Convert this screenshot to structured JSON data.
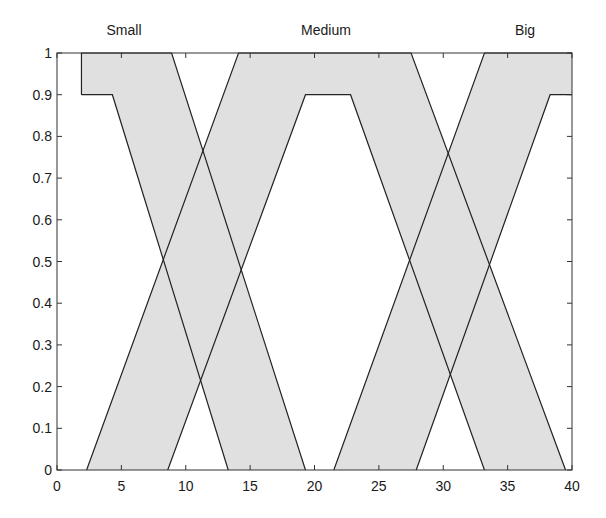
{
  "chart_data": {
    "type": "area",
    "title": "",
    "xlabel": "",
    "ylabel": "",
    "xlim": [
      0,
      40
    ],
    "ylim": [
      0,
      1
    ],
    "grid": false,
    "x_ticks": [
      "0",
      "5",
      "10",
      "15",
      "20",
      "25",
      "30",
      "35",
      "40"
    ],
    "y_ticks": [
      "0",
      "0.1",
      "0.2",
      "0.3",
      "0.4",
      "0.5",
      "0.6",
      "0.7",
      "0.8",
      "0.9",
      "1"
    ],
    "annotations": [
      {
        "text": "Small",
        "x": 8.4
      },
      {
        "text": "Medium",
        "x": 20.9
      },
      {
        "text": "Big",
        "x": 36.4
      }
    ],
    "fill_color": "#e0e0e0",
    "line_color": "#222222",
    "series": [
      {
        "name": "Small",
        "upper": {
          "x": [
            1.9,
            1.9,
            8.9,
            19.3
          ],
          "y": [
            0.9,
            1.0,
            1.0,
            0.0
          ]
        },
        "lower": {
          "x": [
            1.9,
            4.3,
            13.3
          ],
          "y": [
            0.9,
            0.9,
            0.0
          ]
        }
      },
      {
        "name": "Medium",
        "upper": {
          "x": [
            2.3,
            14.1,
            27.5,
            39.5
          ],
          "y": [
            0.0,
            1.0,
            1.0,
            0.0
          ]
        },
        "lower": {
          "x": [
            8.6,
            19.3,
            22.8,
            33.2
          ],
          "y": [
            0.0,
            0.9,
            0.9,
            0.0
          ]
        }
      },
      {
        "name": "Big",
        "upper": {
          "x": [
            21.5,
            33.2,
            40.0
          ],
          "y": [
            0.0,
            1.0,
            1.0
          ]
        },
        "lower": {
          "x": [
            27.9,
            38.3,
            40.0
          ],
          "y": [
            0.0,
            0.9,
            0.9
          ]
        }
      }
    ]
  }
}
